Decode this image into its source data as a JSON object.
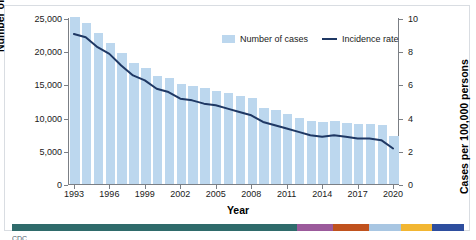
{
  "chart_data": {
    "type": "bar",
    "title": "",
    "xlabel": "Year",
    "ylabel": "Number of cases",
    "y2label": "Cases per 100,000 persons",
    "ylim": [
      0,
      25000
    ],
    "y2lim": [
      0,
      10
    ],
    "grid": false,
    "legend_position": "top-right-inside",
    "categories": [
      "1993",
      "1994",
      "1995",
      "1996",
      "1997",
      "1998",
      "1999",
      "2000",
      "2001",
      "2002",
      "2003",
      "2004",
      "2005",
      "2006",
      "2007",
      "2008",
      "2009",
      "2010",
      "2011",
      "2012",
      "2013",
      "2014",
      "2015",
      "2016",
      "2017",
      "2018",
      "2019",
      "2020"
    ],
    "x_tick_labels": [
      "1993",
      "1996",
      "1999",
      "2002",
      "2005",
      "2008",
      "2011",
      "2014",
      "2017",
      "2020"
    ],
    "y_tick_labels": [
      "0",
      "5,000",
      "10,000",
      "15,000",
      "20,000",
      "25,000"
    ],
    "y_tick_values": [
      0,
      5000,
      10000,
      15000,
      20000,
      25000
    ],
    "y2_tick_labels": [
      "0",
      "2",
      "4",
      "6",
      "8",
      "10"
    ],
    "y2_tick_values": [
      0,
      2,
      4,
      6,
      8,
      10
    ],
    "series": [
      {
        "name": "Number of cases",
        "type": "bar",
        "axis": "left",
        "color": "#bcd7ee",
        "values": [
          25102,
          24206,
          22726,
          21210,
          19751,
          18286,
          17499,
          16308,
          15945,
          15056,
          14835,
          14499,
          14070,
          13728,
          13282,
          12895,
          11520,
          11161,
          10510,
          9940,
          9563,
          9398,
          9546,
          9260,
          9093,
          8996,
          8900,
          7163
        ]
      },
      {
        "name": "Incidence rate",
        "type": "line",
        "axis": "right",
        "color": "#1f3864",
        "values": [
          9.1,
          8.9,
          8.3,
          7.9,
          7.2,
          6.6,
          6.3,
          5.8,
          5.6,
          5.2,
          5.1,
          4.9,
          4.8,
          4.6,
          4.4,
          4.2,
          3.8,
          3.6,
          3.4,
          3.2,
          3.0,
          2.9,
          3.0,
          2.9,
          2.8,
          2.8,
          2.7,
          2.2
        ]
      }
    ],
    "legend": [
      {
        "label": "Number of cases",
        "marker": "bar-swatch",
        "color": "#bcd7ee"
      },
      {
        "label": "Incidence rate",
        "marker": "line-swatch",
        "color": "#1f3864"
      }
    ]
  },
  "footer": {
    "color_strip": [
      {
        "name": "teal-segment",
        "color": "#2f6b6b",
        "width_pct": 63.0
      },
      {
        "name": "purple-segment",
        "color": "#9b5a9b",
        "width_pct": 8.0
      },
      {
        "name": "rust-segment",
        "color": "#c0521e",
        "width_pct": 8.0
      },
      {
        "name": "lightblue-segment",
        "color": "#a8c6e2",
        "width_pct": 7.0
      },
      {
        "name": "gold-segment",
        "color": "#f2b632",
        "width_pct": 7.0
      },
      {
        "name": "navy-segment",
        "color": "#2e4e9e",
        "width_pct": 7.0
      }
    ],
    "cut_text": "CDC"
  }
}
